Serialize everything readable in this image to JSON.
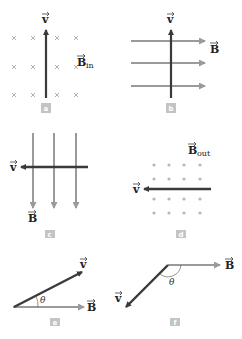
{
  "figure": {
    "panels": [
      {
        "id": "a",
        "tag": "a",
        "v_label": "v",
        "b_label": "B",
        "b_subscript": "in",
        "field": "into page (× symbols)",
        "velocity_direction": "up"
      },
      {
        "id": "b",
        "tag": "b",
        "v_label": "v",
        "b_label": "B",
        "field": "to the right",
        "velocity_direction": "up"
      },
      {
        "id": "c",
        "tag": "c",
        "v_label": "v",
        "b_label": "B",
        "field": "downward",
        "velocity_direction": "left"
      },
      {
        "id": "d",
        "tag": "d",
        "v_label": "v",
        "b_label": "B",
        "b_subscript": "out",
        "field": "out of page (dots)",
        "velocity_direction": "left"
      },
      {
        "id": "e",
        "tag": "e",
        "v_label": "v",
        "b_label": "B",
        "angle_label": "θ",
        "field": "to the right",
        "velocity_direction": "up-right at angle θ"
      },
      {
        "id": "f",
        "tag": "f",
        "v_label": "v",
        "b_label": "B",
        "angle_label": "θ",
        "field": "to the right",
        "velocity_direction": "down-left at obtuse angle θ"
      }
    ],
    "colors": {
      "velocity_arrow": "#3a3a3a",
      "field_arrow": "#9a9a9a",
      "field_symbol": "#b0b0b0",
      "tag_bg": "#c4c4c4"
    }
  }
}
